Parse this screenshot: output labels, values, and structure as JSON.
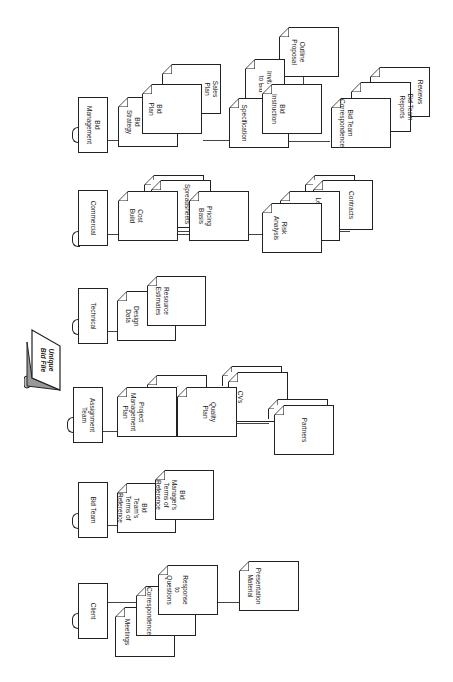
{
  "diagram": {
    "title": "Unique Bid File",
    "categories": [
      {
        "label": "Bid Management",
        "documents": [
          "Bid Strategy",
          "Bid Plan",
          "Sales Plan",
          "Specification",
          "Invitation to Bid",
          "Bid Instruction",
          "Outline Proposal",
          "Bid Team Correspondence",
          "Bid Team Reports",
          "Reviews"
        ]
      },
      {
        "label": "Commercial",
        "documents": [
          "Cost Build",
          "Spreadsheets",
          "Pricing Basis",
          "Risk Analysis",
          "Legal Report",
          "Contracts"
        ]
      },
      {
        "label": "Technical",
        "documents": [
          "Design Data",
          "Resource Estimates"
        ]
      },
      {
        "label": "Assignment Team",
        "documents": [
          "Project Management Plan",
          "Project Timetable",
          "Quality Plan",
          "CVs",
          "Partners"
        ]
      },
      {
        "label": "Bid Team",
        "documents": [
          "Bid Team's Terms of Reference",
          "Bid Manager's Terms of Reference"
        ]
      },
      {
        "label": "Client",
        "documents": [
          "Meetings",
          "Correspondence",
          "Response to Questions",
          "Presentation Material"
        ]
      }
    ]
  },
  "labels": {
    "ubf": "Unique\nBid File",
    "bidmgmt": "Bid\nManagement",
    "bidstrategy": "Bid\nStrategy",
    "bidplan": "Bid\nPlan",
    "salesplan": "Sales\nPlan",
    "specification": "Specification",
    "itb": "Invitation\nto Bid",
    "bidinstr": "Bid\nInstruction",
    "outline": "Outline\nProposal",
    "btcorr": "Bid Team\nCorrespondence",
    "btreports": "Bid Team\nReports",
    "reviews": "Reviews",
    "commercial": "Commercial",
    "costbuild": "Cost\nBuild",
    "spreadsheets": "Spreadsheets",
    "pricing": "Pricing\nBasis",
    "risk": "Risk\nAnalysis",
    "legal": "Legal Report",
    "contracts": "Contracts",
    "technical": "Technical",
    "design": "Design\nData",
    "resource": "Resource\nEstimates",
    "assignment": "Assignment\nTeam",
    "pmp": "Project\nManagement\nPlan",
    "timetable": "Project\nTimetable",
    "quality": "Quality\nPlan",
    "cvs": "CVs",
    "partners": "Partners",
    "bidteam": "Bid Team",
    "btterms": "Bid\nTeam's\nTerms of\nReference",
    "bmterms": "Bid\nManager's\nTerms of\nReference",
    "client": "Client",
    "meetings": "Meetings",
    "correspondence": "Correspondence",
    "response": "Response\nto\nQuestions",
    "presentation": "Presentation\nMaterial"
  }
}
